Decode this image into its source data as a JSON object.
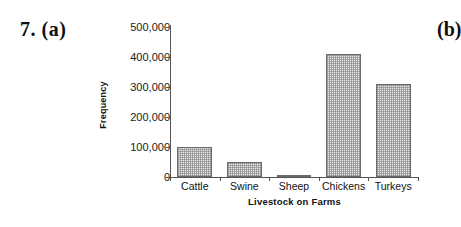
{
  "problem": {
    "number_label": "7. (a)",
    "part_b_label": "(b)"
  },
  "chart_data": {
    "type": "bar",
    "title": "",
    "xlabel": "Livestock on Farms",
    "ylabel": "Frequency",
    "categories": [
      "Cattle",
      "Swine",
      "Sheep",
      "Chickens",
      "Turkeys"
    ],
    "values": [
      100000,
      50000,
      7000,
      410000,
      310000
    ],
    "ylim": [
      0,
      500000
    ],
    "yticks": [
      0,
      100000,
      200000,
      300000,
      400000,
      500000
    ],
    "ytick_labels": [
      "0",
      "100,000",
      "200,000",
      "300,000",
      "400,000",
      "500,000"
    ],
    "grid": false,
    "legend": null,
    "bar_fill": "#e9e9e9",
    "bar_edge": "#6a6a6a",
    "axis_color": "#555555",
    "background": "#ffffff"
  }
}
